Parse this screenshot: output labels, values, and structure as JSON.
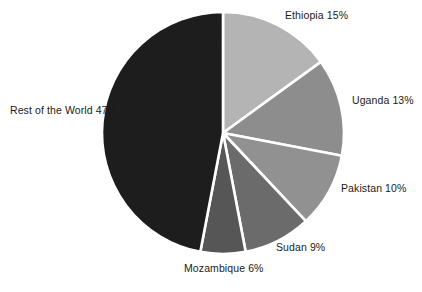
{
  "chart_data": {
    "type": "pie",
    "title": "",
    "subtitle": "",
    "xlabel": "",
    "ylabel": "",
    "legend_position": "none",
    "grid": false,
    "units": "percent",
    "start_angle_deg": 0,
    "direction": "clockwise",
    "categories": [
      "Ethiopia",
      "Uganda",
      "Pakistan",
      "Sudan",
      "Mozambique",
      "Rest of the World"
    ],
    "values": [
      15,
      13,
      10,
      9,
      6,
      47
    ],
    "labels": [
      "Ethiopia 15%",
      "Uganda 13%",
      "Pakistan 10%",
      "Sudan 9%",
      "Mozambique 6%",
      "Rest of the World 47%"
    ],
    "slices": [
      {
        "name": "Ethiopia",
        "value": 15,
        "label": "Ethiopia 15%",
        "color": "#b4b4b4"
      },
      {
        "name": "Uganda",
        "value": 13,
        "label": "Uganda 13%",
        "color": "#8d8d8d"
      },
      {
        "name": "Pakistan",
        "value": 10,
        "label": "Pakistan 10%",
        "color": "#919191"
      },
      {
        "name": "Sudan",
        "value": 9,
        "label": "Sudan 9%",
        "color": "#6b6b6b"
      },
      {
        "name": "Mozambique",
        "value": 6,
        "label": "Mozambique 6%",
        "color": "#565656"
      },
      {
        "name": "Rest of the World",
        "value": 47,
        "label": "Rest of the World 47%",
        "color": "#1d1d1d"
      }
    ]
  },
  "figure": {
    "background_color": "#ffffff",
    "separator_color": "#ffffff",
    "label_color": "#1b1b1b",
    "center_x": 223,
    "center_y": 133,
    "radius": 121
  }
}
